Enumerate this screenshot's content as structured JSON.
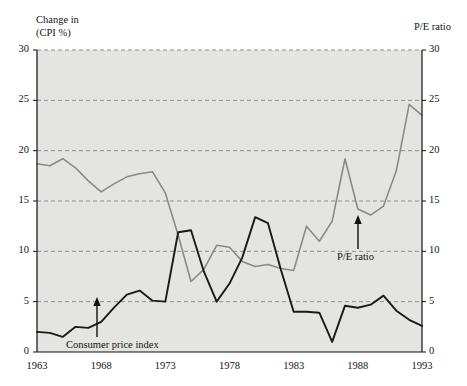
{
  "figure": {
    "left_axis_caption": "Change in\n(CPI %)",
    "right_axis_caption": "P/E ratio",
    "plot_background_color": "#e4e4e2",
    "grid_color": "#8f8f8f",
    "cpi_line_color": "#1a1a1a",
    "pe_line_color": "#8a8a8a",
    "annotations": [
      {
        "text": "Consumer price index",
        "name": "annotation-consumer-price-index"
      },
      {
        "text": "P/E ratio",
        "name": "annotation-pe-ratio"
      }
    ]
  },
  "chart_data": {
    "type": "line",
    "title": "",
    "xlabel": "",
    "ylabel": "Change in (CPI %)",
    "y2label": "P/E ratio",
    "xlim": [
      1963,
      1993
    ],
    "ylim": [
      0,
      30
    ],
    "y2lim": [
      0,
      30
    ],
    "grid": true,
    "legend": "annotated-inline",
    "xticks": [
      1963,
      1968,
      1973,
      1978,
      1983,
      1988,
      1993
    ],
    "xtick_labels": [
      "1963",
      "1968",
      "1973",
      "1978",
      "1983",
      "1988",
      "1993"
    ],
    "yticks": [
      0,
      5,
      10,
      15,
      20,
      25,
      30
    ],
    "ytick_labels": [
      "0",
      "5",
      "10",
      "15",
      "20",
      "25",
      "30"
    ],
    "y2ticks": [
      0,
      5,
      10,
      15,
      20,
      25,
      30
    ],
    "y2tick_labels": [
      "0",
      "5",
      "10",
      "15",
      "20",
      "25",
      "30"
    ],
    "x": [
      1963,
      1964,
      1965,
      1966,
      1967,
      1968,
      1969,
      1970,
      1971,
      1972,
      1973,
      1974,
      1975,
      1976,
      1977,
      1978,
      1979,
      1980,
      1981,
      1982,
      1983,
      1984,
      1985,
      1986,
      1987,
      1988,
      1989,
      1990,
      1991,
      1992,
      1993
    ],
    "series": [
      {
        "name": "Consumer price index",
        "axis": "left",
        "color": "#1a1a1a",
        "values": [
          2.0,
          1.9,
          1.5,
          2.5,
          2.4,
          3.0,
          4.4,
          5.7,
          6.1,
          5.1,
          5.0,
          11.9,
          12.1,
          8.0,
          5.0,
          6.8,
          9.4,
          13.4,
          12.8,
          8.2,
          4.0,
          4.0,
          3.9,
          1.0,
          4.6,
          4.4,
          4.7,
          5.6,
          4.1,
          3.2,
          2.6
        ]
      },
      {
        "name": "P/E ratio",
        "axis": "right",
        "color": "#8a8a8a",
        "values": [
          18.7,
          18.5,
          19.2,
          18.3,
          17.0,
          15.9,
          16.7,
          17.4,
          17.7,
          17.9,
          15.8,
          11.6,
          7.0,
          8.2,
          10.6,
          10.4,
          9.0,
          8.5,
          8.7,
          8.3,
          8.1,
          12.5,
          11.0,
          13.0,
          19.2,
          14.2,
          13.6,
          14.5,
          18.0,
          24.6,
          23.5
        ]
      }
    ]
  }
}
